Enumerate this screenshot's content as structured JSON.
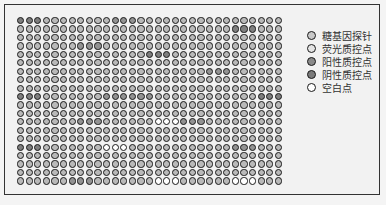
{
  "legend": {
    "items": [
      {
        "key": "probe",
        "label": "糖基因探针",
        "color": "#c8c8c8"
      },
      {
        "key": "fluor",
        "label": "荧光质控点",
        "color": "#e4e4e4"
      },
      {
        "key": "pos",
        "label": "阳性质控点",
        "color": "#8a8a8a"
      },
      {
        "key": "neg",
        "label": "阴性质控点",
        "color": "#7a7a7a"
      },
      {
        "key": "blank",
        "label": "空白点",
        "color": "#ffffff"
      }
    ]
  },
  "grid": {
    "rows": 20,
    "cols": 31,
    "default_color": "#b9b9b9",
    "spots": [
      {
        "row": 0,
        "cols": [
          0,
          1,
          2
        ],
        "type": "neg"
      },
      {
        "row": 0,
        "cols": [
          11,
          12,
          13
        ],
        "type": "pos"
      },
      {
        "row": 1,
        "cols": [
          25,
          26,
          27
        ],
        "type": "neg"
      },
      {
        "row": 3,
        "cols": [
          7,
          8,
          9
        ],
        "type": "pos"
      },
      {
        "row": 4,
        "cols": [
          15,
          16,
          17
        ],
        "type": "neg"
      },
      {
        "row": 6,
        "cols": [
          22,
          23,
          24
        ],
        "type": "pos"
      },
      {
        "row": 9,
        "cols": [
          0,
          1,
          2
        ],
        "type": "neg"
      },
      {
        "row": 9,
        "cols": [
          10,
          11,
          12
        ],
        "type": "pos"
      },
      {
        "row": 9,
        "cols": [
          13,
          14,
          15
        ],
        "type": "pos"
      },
      {
        "row": 9,
        "cols": [
          28,
          29,
          30
        ],
        "type": "neg"
      },
      {
        "row": 12,
        "cols": [
          7,
          8,
          9
        ],
        "type": "pos"
      },
      {
        "row": 12,
        "cols": [
          16,
          17,
          18
        ],
        "type": "blank"
      },
      {
        "row": 12,
        "cols": [
          19,
          20,
          21
        ],
        "type": "pos"
      },
      {
        "row": 15,
        "cols": [
          0,
          1,
          2
        ],
        "type": "neg"
      },
      {
        "row": 15,
        "cols": [
          10,
          11,
          12
        ],
        "type": "blank"
      },
      {
        "row": 15,
        "cols": [
          25,
          26,
          27
        ],
        "type": "pos"
      },
      {
        "row": 19,
        "cols": [
          6,
          7,
          8
        ],
        "type": "pos"
      },
      {
        "row": 19,
        "cols": [
          16,
          17,
          18
        ],
        "type": "blank"
      },
      {
        "row": 19,
        "cols": [
          25,
          26,
          27
        ],
        "type": "blank"
      }
    ],
    "type_colors": {
      "neg": "#7e7e7e",
      "pos": "#929292",
      "blank": "#ffffff",
      "fluor": "#dedede"
    }
  }
}
